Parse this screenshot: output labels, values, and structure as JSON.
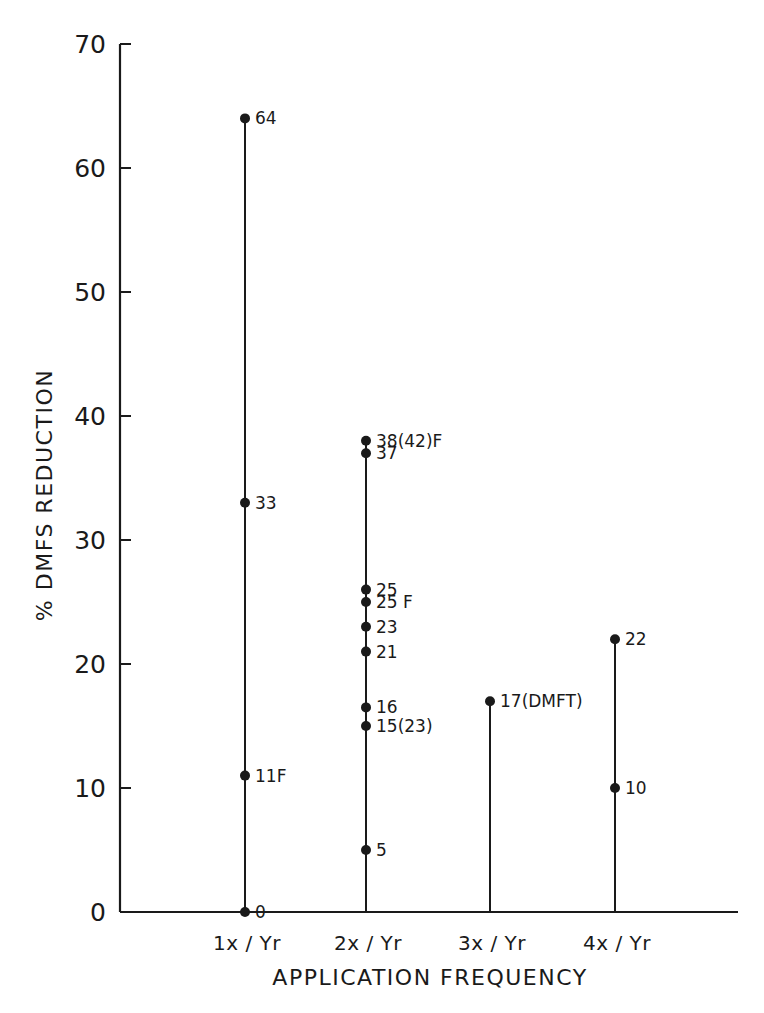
{
  "chart_data": {
    "type": "scatter",
    "title": "",
    "xlabel": "APPLICATION FREQUENCY",
    "ylabel": "% DMFS REDUCTION",
    "ylim": [
      0,
      70
    ],
    "yticks": [
      0,
      10,
      20,
      30,
      40,
      50,
      60,
      70
    ],
    "grid": false,
    "legend": null,
    "categories": [
      "1x / Yr",
      "2x / Yr",
      "3x / Yr",
      "4x / Yr"
    ],
    "series": [
      {
        "category": "1x / Yr",
        "points": [
          {
            "value": 64,
            "label": "64"
          },
          {
            "value": 33,
            "label": "33"
          },
          {
            "value": 11,
            "label": "11F"
          },
          {
            "value": 0,
            "label": "0"
          }
        ]
      },
      {
        "category": "2x / Yr",
        "points": [
          {
            "value": 38,
            "label": "38(42)F"
          },
          {
            "value": 37,
            "label": "37"
          },
          {
            "value": 26,
            "label": "25"
          },
          {
            "value": 25,
            "label": "25 F"
          },
          {
            "value": 23,
            "label": "23"
          },
          {
            "value": 21,
            "label": "21"
          },
          {
            "value": 16.5,
            "label": "16"
          },
          {
            "value": 15,
            "label": "15(23)"
          },
          {
            "value": 5,
            "label": "5"
          }
        ]
      },
      {
        "category": "3x / Yr",
        "points": [
          {
            "value": 17,
            "label": "17(DMFT)"
          }
        ]
      },
      {
        "category": "4x / Yr",
        "points": [
          {
            "value": 22,
            "label": "22"
          },
          {
            "value": 10,
            "label": "10"
          }
        ]
      }
    ],
    "annotations": [
      "F = fluoride",
      "(DMFT)",
      "(23)",
      "(42)"
    ]
  },
  "colors": {
    "ink": "#1a1a1a",
    "background": "#ffffff"
  }
}
